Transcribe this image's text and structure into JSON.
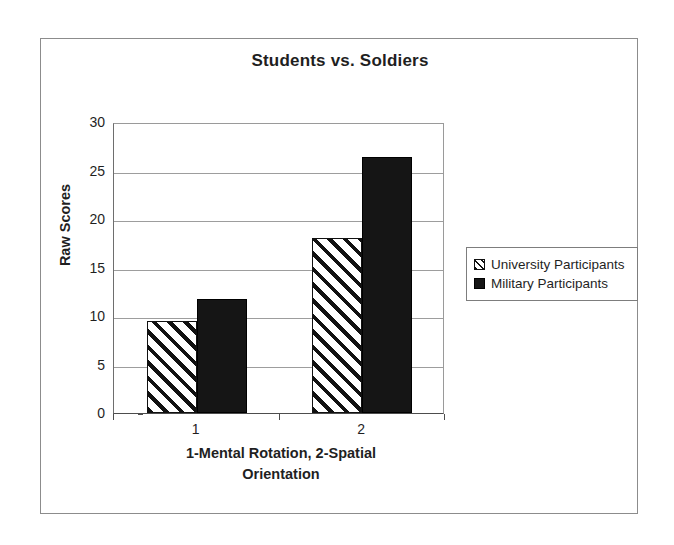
{
  "chart_data": {
    "type": "bar",
    "title": "Students vs. Soldiers",
    "xlabel": "1-Mental Rotation, 2-Spatial Orientation",
    "xlabel_line1": "1-Mental Rotation, 2-Spatial",
    "xlabel_line2": "Orientation",
    "ylabel": "Raw Scores",
    "categories": [
      "1",
      "2"
    ],
    "ylim": [
      0,
      30
    ],
    "ytick_values": [
      0,
      5,
      10,
      15,
      20,
      25,
      30
    ],
    "ytick_labels": [
      "0",
      "5",
      "10",
      "15",
      "20",
      "25",
      "30"
    ],
    "grid": "horizontal",
    "legend_position": "right",
    "series": [
      {
        "name": "University Participants",
        "fill": "hatched-diagonal",
        "color": "#111111",
        "values": [
          9.5,
          18.0
        ]
      },
      {
        "name": "Military Participants",
        "fill": "solid",
        "color": "#151515",
        "values": [
          11.8,
          26.4
        ]
      }
    ]
  },
  "legend": {
    "items": [
      {
        "label": "University Participants",
        "swatch": "hatched-swatch-icon"
      },
      {
        "label": "Military Participants",
        "swatch": "solid-swatch-icon"
      }
    ]
  }
}
